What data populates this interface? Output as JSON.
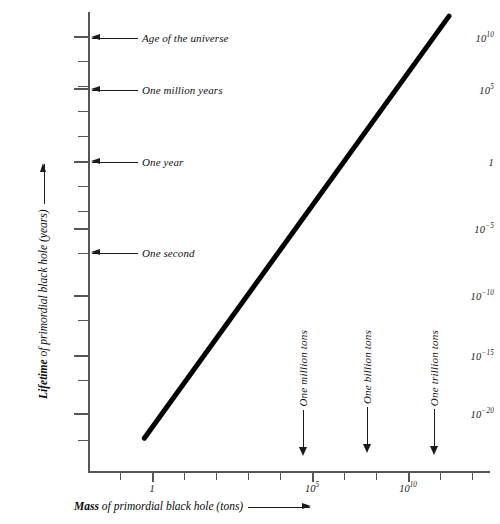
{
  "chart_data": {
    "type": "line",
    "title": "",
    "xlabel": "Mass of primordial black hole (tons)",
    "ylabel": "Lifetime of primordial black hole (years)",
    "xlabel_bold_prefix": "Mass",
    "xlabel_rest": " of primordial black hole (tons)",
    "ylabel_bold_prefix": "Lifetime",
    "ylabel_rest": " of primordial black hole (years)",
    "x_scale": "log10",
    "y_scale": "log10",
    "xlim": [
      -2.5,
      13.0
    ],
    "ylim": [
      -23.0,
      12.0
    ],
    "grid": false,
    "legend": "none",
    "x_tick_exponents": [
      -2,
      -1,
      0,
      1,
      2,
      3,
      4,
      5,
      6,
      7,
      8,
      9,
      10,
      11,
      12
    ],
    "y_tick_exponents": [
      10,
      8,
      6,
      4,
      2,
      0,
      -2,
      -4,
      -6,
      -8,
      -10,
      -12,
      -14,
      -16,
      -18,
      -20,
      -22
    ],
    "x_tick_labels": [
      {
        "exponent": 0,
        "text": "1",
        "mantissa": "1",
        "sup": ""
      },
      {
        "exponent": 5,
        "text": "10^5",
        "mantissa": "10",
        "sup": "5"
      },
      {
        "exponent": 10,
        "text": "10^10",
        "mantissa": "10",
        "sup": "10"
      }
    ],
    "y_tick_labels": [
      {
        "exponent": 10,
        "text": "10^10",
        "mantissa": "10",
        "sup": "10"
      },
      {
        "exponent": 5,
        "text": "10^5",
        "mantissa": "10",
        "sup": "5"
      },
      {
        "exponent": 0,
        "text": "1",
        "mantissa": "1",
        "sup": ""
      },
      {
        "exponent": -5,
        "text": "10^-5",
        "mantissa": "10",
        "sup": "−5"
      },
      {
        "exponent": -10,
        "text": "10^-10",
        "mantissa": "10",
        "sup": "−10"
      },
      {
        "exponent": -15,
        "text": "10^-15",
        "mantissa": "10",
        "sup": "−15"
      },
      {
        "exponent": -20,
        "text": "10^-20",
        "mantissa": "10",
        "sup": "−20"
      }
    ],
    "series": [
      {
        "name": "Black hole lifetime vs mass",
        "points": [
          {
            "x_log10": -0.3,
            "y_log10": -22.0
          },
          {
            "x_log10": 11.6,
            "y_log10": 11.5
          }
        ],
        "color": "#000000",
        "line_width_px": 5
      }
    ],
    "y_annotations": [
      {
        "label": "Age of the universe",
        "y_log10": 10.0
      },
      {
        "label": "One million years",
        "y_log10": 6.0
      },
      {
        "label": "One year",
        "y_log10": 0.0
      },
      {
        "label": "One second",
        "y_log10": -7.5
      }
    ],
    "x_annotations": [
      {
        "label": "One million tons",
        "x_log10": 6.7
      },
      {
        "label": "One billion tons",
        "x_log10": 8.7
      },
      {
        "label": "One trillion tons",
        "x_log10": 10.8
      }
    ]
  },
  "colors": {
    "background": "#ffffff",
    "axis": "#555555",
    "text": "#111111",
    "curve": "#000000"
  }
}
